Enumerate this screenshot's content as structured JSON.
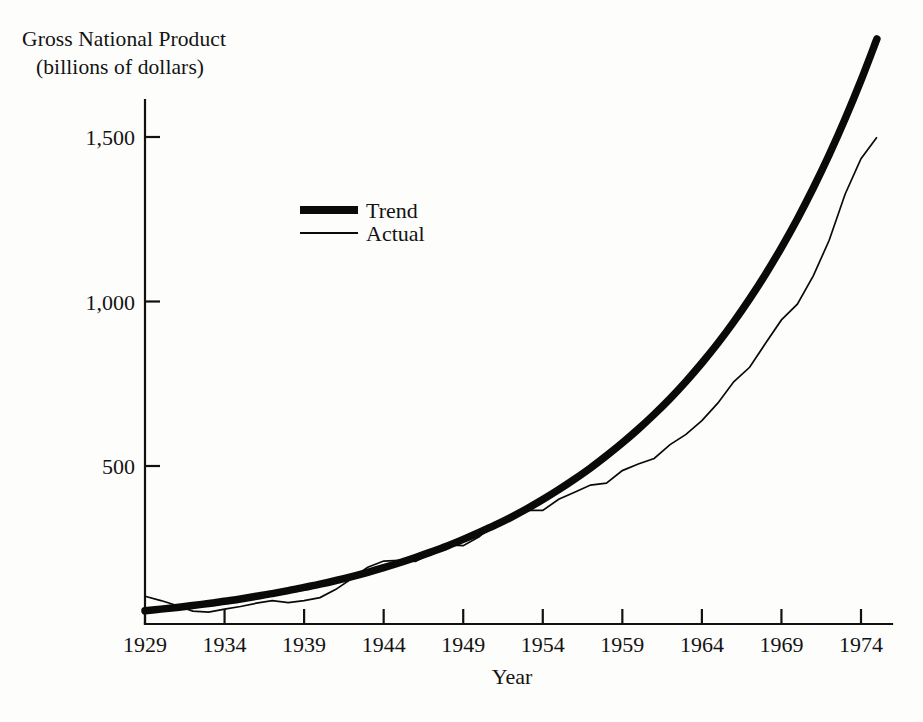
{
  "figure": {
    "title_line1": "Gross National Product",
    "title_line2": "(billions of dollars)",
    "background": "#fdfdfb",
    "ink": "#0a0a0a"
  },
  "chart_data": {
    "type": "line",
    "title": "Gross National Product (billions of dollars)",
    "xlabel": "Year",
    "ylabel": "Gross National Product (billions of dollars)",
    "grid": false,
    "legend_position": "upper-left-inside",
    "xlim": [
      1929,
      1975.5
    ],
    "ylim": [
      20,
      1660
    ],
    "xticks": [
      1929,
      1934,
      1939,
      1944,
      1949,
      1954,
      1959,
      1964,
      1969,
      1974
    ],
    "xticklabels": [
      "1929",
      "1934",
      "1939",
      "1944",
      "1949",
      "1954",
      "1959",
      "1964",
      "1969",
      "1974"
    ],
    "yticks": [
      500,
      1000,
      1500
    ],
    "yticklabels": [
      "500",
      "1,000",
      "1,500"
    ],
    "x": [
      1929,
      1930,
      1931,
      1932,
      1933,
      1934,
      1935,
      1936,
      1937,
      1938,
      1939,
      1940,
      1941,
      1942,
      1943,
      1944,
      1945,
      1946,
      1947,
      1948,
      1949,
      1950,
      1951,
      1952,
      1953,
      1954,
      1955,
      1956,
      1957,
      1958,
      1959,
      1960,
      1961,
      1962,
      1963,
      1964,
      1965,
      1966,
      1967,
      1968,
      1969,
      1970,
      1971,
      1972,
      1973,
      1974,
      1975
    ],
    "series": [
      {
        "name": "Trend",
        "style": "thick",
        "values": [
          60,
          65,
          70,
          76,
          82,
          89,
          96,
          104,
          112,
          121,
          131,
          141,
          152,
          164,
          177,
          191,
          206,
          222,
          239,
          257,
          277,
          298,
          320,
          344,
          370,
          398,
          428,
          460,
          494,
          531,
          570,
          612,
          657,
          705,
          757,
          813,
          873,
          938,
          1008,
          1083,
          1164,
          1251,
          1345,
          1446,
          1555,
          1672,
          1798
        ]
      },
      {
        "name": "Actual",
        "style": "thin",
        "values": [
          104,
          91,
          76,
          59,
          56,
          65,
          73,
          83,
          91,
          85,
          91,
          100,
          125,
          158,
          192,
          211,
          213,
          210,
          234,
          260,
          258,
          285,
          328,
          346,
          365,
          365,
          399,
          420,
          442,
          448,
          486,
          506,
          523,
          565,
          596,
          638,
          691,
          756,
          800,
          873,
          944,
          992,
          1078,
          1186,
          1326,
          1434,
          1499
        ]
      }
    ],
    "annotations": []
  },
  "legend": {
    "items": [
      {
        "label": "Trend",
        "style": "thick"
      },
      {
        "label": "Actual",
        "style": "thin"
      }
    ]
  },
  "axes": {
    "y_tick_labels": [
      "1,500",
      "1,000",
      "500"
    ],
    "x_tick_labels": [
      "1929",
      "1934",
      "1939",
      "1944",
      "1949",
      "1954",
      "1959",
      "1964",
      "1969",
      "1974"
    ],
    "x_axis_title": "Year"
  }
}
